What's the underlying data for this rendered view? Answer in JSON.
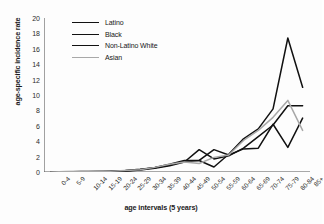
{
  "chart_data": {
    "type": "line",
    "title": "",
    "xlabel": "age intervals (5 years)",
    "ylabel": "age-specific incidence rate",
    "ylim": [
      0,
      20
    ],
    "ytick_step": 2,
    "yticks": [
      0,
      2,
      4,
      6,
      8,
      10,
      12,
      14,
      16,
      18,
      20
    ],
    "grid": false,
    "legend_position": "top-left-inside",
    "categories": [
      "0-4",
      "5-9",
      "10-14",
      "15-19",
      "20-24",
      "25-29",
      "30-34",
      "35-39",
      "40-44",
      "45-49",
      "50-54",
      "55-59",
      "60-64",
      "65-69",
      "70-74",
      "75-79",
      "80-84",
      "85+"
    ],
    "series": [
      {
        "name": "Latino",
        "color": "#111111",
        "values": [
          0,
          0,
          0,
          0,
          0.05,
          0.1,
          0.25,
          0.5,
          0.8,
          1.3,
          2.9,
          1.7,
          2.1,
          3.1,
          4.6,
          6.1,
          8.6,
          8.6
        ]
      },
      {
        "name": "Black",
        "color": "#111111",
        "values": [
          0,
          0,
          0.05,
          0.05,
          0.1,
          0.2,
          0.35,
          0.55,
          0.9,
          1.4,
          1.5,
          2.9,
          2.2,
          3.0,
          3.1,
          6.2,
          3.2,
          7.0
        ]
      },
      {
        "name": "Non-Latino White",
        "color": "#111111",
        "values": [
          0,
          0,
          0,
          0.05,
          0.1,
          0.15,
          0.3,
          0.6,
          1.0,
          1.5,
          1.5,
          0.65,
          2.3,
          4.3,
          5.6,
          8.2,
          17.4,
          11.0
        ]
      },
      {
        "name": "Asian",
        "color": "#a8a8a8",
        "values": [
          0,
          0.05,
          0.1,
          0.1,
          0.1,
          0.2,
          0.3,
          0.6,
          1.0,
          1.3,
          1.1,
          1.9,
          2.2,
          4.1,
          5.4,
          7.1,
          9.3,
          5.4
        ]
      }
    ]
  },
  "legend": {
    "items": [
      {
        "label": "Latino"
      },
      {
        "label": "Black"
      },
      {
        "label": "Non-Latino White"
      },
      {
        "label": "Asian"
      }
    ]
  }
}
